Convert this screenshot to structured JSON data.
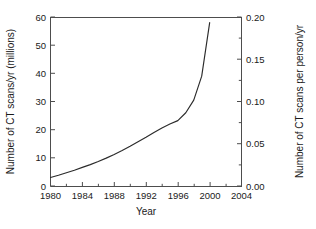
{
  "chart_data": {
    "type": "line",
    "title": "",
    "subtitle": "",
    "xlabel": "Year",
    "ylabel": "Number of CT scans/yr (millions)",
    "ylabel_right": "Number of CT scans per person/yr",
    "xlim": [
      1980,
      2004
    ],
    "ylim": [
      0,
      60
    ],
    "ylim_right": [
      0.0,
      0.2
    ],
    "grid": false,
    "legend": false,
    "legend_position": "none",
    "x_ticks": [
      1980,
      1984,
      1988,
      1992,
      1996,
      2000,
      2004
    ],
    "x_tick_labels": [
      "1980",
      "1984",
      "1988",
      "1992",
      "1996",
      "2000",
      "2004"
    ],
    "x_minor_ticks": [
      1982,
      1986,
      1990,
      1994,
      1998,
      2002
    ],
    "y_ticks": [
      0,
      10,
      20,
      30,
      40,
      50,
      60
    ],
    "y_tick_labels": [
      "0",
      "10",
      "20",
      "30",
      "40",
      "50",
      "60"
    ],
    "y_ticks_right": [
      0.0,
      0.05,
      0.1,
      0.15,
      0.2
    ],
    "y_tick_labels_right": [
      "0.00",
      "0.05",
      "0.10",
      "0.15",
      "0.20"
    ],
    "y_minor_ticks_right": [
      0.025,
      0.075,
      0.125,
      0.175
    ],
    "series": [
      {
        "name": "CT scans per year",
        "color": "#2b2b2b",
        "x": [
          1980,
          1981,
          1982,
          1983,
          1984,
          1985,
          1986,
          1987,
          1988,
          1989,
          1990,
          1991,
          1992,
          1993,
          1994,
          1995,
          1996,
          1997,
          1998,
          1999,
          2000
        ],
        "values": [
          3.0,
          3.8,
          4.7,
          5.6,
          6.6,
          7.6,
          8.7,
          9.9,
          11.2,
          12.6,
          14.1,
          15.7,
          17.3,
          19.0,
          20.6,
          22.0,
          23.2,
          26.0,
          30.5,
          39.0,
          58.0
        ]
      }
    ],
    "annotations": []
  },
  "axis_colors": {
    "frame": "#4d4d4d",
    "curve": "#2b2b2b",
    "text": "#1a1a1a",
    "background": "#ffffff"
  }
}
